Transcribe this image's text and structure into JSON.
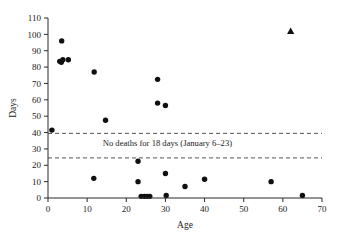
{
  "chart_data": {
    "type": "scatter",
    "title": "",
    "xlabel": "Age",
    "ylabel": "Days",
    "xlim": [
      0,
      70
    ],
    "ylim": [
      0,
      110
    ],
    "xticks": [
      0,
      10,
      20,
      30,
      40,
      50,
      60,
      70
    ],
    "yticks": [
      0,
      10,
      20,
      30,
      40,
      50,
      60,
      70,
      80,
      90,
      100,
      110
    ],
    "xtick_labels": [
      "0",
      "10",
      "20",
      "30",
      "40",
      "50",
      "60",
      "70"
    ],
    "ytick_labels": [
      "0",
      "10",
      "20",
      "30",
      "40",
      "50",
      "60",
      "70",
      "80",
      "90",
      "100",
      "110"
    ],
    "grid": false,
    "legend": false,
    "series": [
      {
        "name": "deaths",
        "marker": "circle",
        "color": "#101010",
        "points": [
          {
            "x": 1.0,
            "y": 41.5
          },
          {
            "x": 3.5,
            "y": 96.0
          },
          {
            "x": 3.0,
            "y": 83.5
          },
          {
            "x": 3.4,
            "y": 83.0
          },
          {
            "x": 3.8,
            "y": 84.5
          },
          {
            "x": 5.2,
            "y": 84.5
          },
          {
            "x": 11.8,
            "y": 77.0
          },
          {
            "x": 14.7,
            "y": 47.5
          },
          {
            "x": 11.7,
            "y": 12.0
          },
          {
            "x": 23.0,
            "y": 22.5
          },
          {
            "x": 23.0,
            "y": 10.0
          },
          {
            "x": 23.8,
            "y": 1.0
          },
          {
            "x": 24.6,
            "y": 1.0
          },
          {
            "x": 25.3,
            "y": 1.0
          },
          {
            "x": 26.0,
            "y": 1.0
          },
          {
            "x": 28.0,
            "y": 72.5
          },
          {
            "x": 28.0,
            "y": 58.0
          },
          {
            "x": 30.0,
            "y": 56.5
          },
          {
            "x": 30.0,
            "y": 15.0
          },
          {
            "x": 30.2,
            "y": 1.5
          },
          {
            "x": 35.0,
            "y": 7.0
          },
          {
            "x": 40.0,
            "y": 11.5
          },
          {
            "x": 57.0,
            "y": 10.0
          },
          {
            "x": 65.0,
            "y": 1.5
          }
        ]
      },
      {
        "name": "outlier",
        "marker": "triangle",
        "color": "#101010",
        "points": [
          {
            "x": 62.0,
            "y": 102.0
          }
        ]
      }
    ],
    "reference_lines": [
      {
        "name": "upper-gap-line",
        "y": 39.5,
        "style": "dashed"
      },
      {
        "name": "lower-gap-line",
        "y": 24.5,
        "style": "dashed"
      }
    ],
    "annotations": [
      {
        "name": "no-deaths-gap-label",
        "text": "No deaths for 18 days (January 6–23)",
        "x": 30.5,
        "y": 31.5
      }
    ]
  },
  "caption": {
    "text": ""
  }
}
